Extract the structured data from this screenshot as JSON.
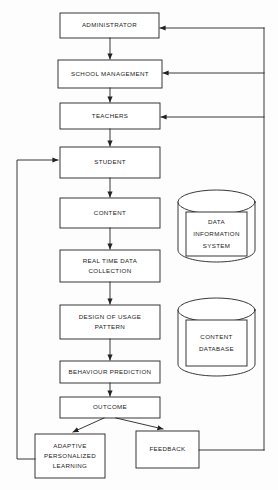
{
  "diagram": {
    "background_color": "#fdfdfd",
    "stroke_color": "#222222",
    "text_color": "#1b1b1b",
    "process_nodes": [
      {
        "id": "administrator",
        "label": "ADMINISTRATOR",
        "x": 60,
        "y": 13,
        "w": 99,
        "h": 25
      },
      {
        "id": "school-management",
        "label": "SCHOOL MANAGEMENT",
        "x": 58,
        "y": 60,
        "w": 104,
        "h": 28
      },
      {
        "id": "teachers",
        "label": "TEACHERS",
        "x": 60,
        "y": 103,
        "w": 100,
        "h": 26
      },
      {
        "id": "student",
        "label": "STUDENT",
        "x": 60,
        "y": 147,
        "w": 100,
        "h": 31
      },
      {
        "id": "content",
        "label": "CONTENT",
        "x": 60,
        "y": 198,
        "w": 100,
        "h": 30
      },
      {
        "id": "real-time-data",
        "label": "REAL TIME DATA\nCOLLECTION",
        "x": 60,
        "y": 250,
        "w": 100,
        "h": 32
      },
      {
        "id": "design-usage",
        "label": "DESIGN OF USAGE\nPATTERN",
        "x": 60,
        "y": 305,
        "w": 100,
        "h": 34
      },
      {
        "id": "behaviour",
        "label": "BEHAVIOUR PREDICTION",
        "x": 60,
        "y": 361,
        "w": 100,
        "h": 22
      },
      {
        "id": "outcome",
        "label": "OUTCOME",
        "x": 60,
        "y": 397,
        "w": 100,
        "h": 21
      },
      {
        "id": "adaptive-learning",
        "label": "ADAPTIVE\nPERSONALIZED\nLEARNING",
        "x": 35,
        "y": 434,
        "w": 70,
        "h": 44
      },
      {
        "id": "feedback",
        "label": "FEEDBACK",
        "x": 136,
        "y": 431,
        "w": 63,
        "h": 37
      }
    ],
    "data_stores": [
      {
        "id": "data-information-system",
        "label": "DATA\nINFORMATION\nSYSTEM",
        "x": 178,
        "y": 190,
        "w": 77,
        "h": 72
      },
      {
        "id": "content-database",
        "label": "CONTENT\nDATABASE",
        "x": 178,
        "y": 298,
        "w": 77,
        "h": 78
      }
    ],
    "connectors": [
      {
        "from": "administrator",
        "to": "school-management",
        "kind": "vertical-arrow"
      },
      {
        "from": "school-management",
        "to": "teachers",
        "kind": "vertical-arrow"
      },
      {
        "from": "teachers",
        "to": "student",
        "kind": "vertical-arrow"
      },
      {
        "from": "student",
        "to": "content",
        "kind": "vertical-arrow"
      },
      {
        "from": "content",
        "to": "real-time-data",
        "kind": "vertical-arrow"
      },
      {
        "from": "real-time-data",
        "to": "design-usage",
        "kind": "vertical-arrow"
      },
      {
        "from": "design-usage",
        "to": "behaviour",
        "kind": "vertical-arrow"
      },
      {
        "from": "behaviour",
        "to": "outcome",
        "kind": "vertical-arrow"
      },
      {
        "from": "outcome",
        "to": "adaptive-learning",
        "kind": "diagonal-arrow"
      },
      {
        "from": "outcome",
        "to": "feedback",
        "kind": "diagonal-arrow"
      },
      {
        "from": "adaptive-learning",
        "to": "student",
        "kind": "left-loop-arrow"
      },
      {
        "from": "feedback",
        "to": "teachers",
        "kind": "right-loop-arrow"
      },
      {
        "from": "feedback",
        "to": "school-management",
        "kind": "right-loop-arrow"
      },
      {
        "from": "feedback",
        "to": "administrator",
        "kind": "right-loop-arrow"
      }
    ]
  }
}
